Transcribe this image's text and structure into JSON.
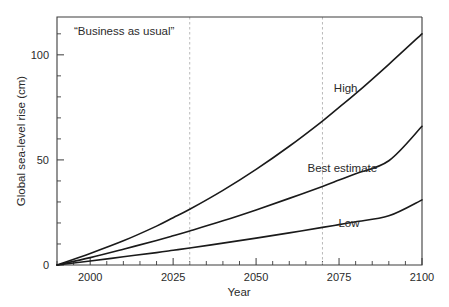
{
  "chart_data": {
    "type": "line",
    "title": "",
    "annotation": "“Business as usual”",
    "xlabel": "Year",
    "ylabel": "Global sea-level rise (cm)",
    "xlim": [
      1990,
      2100
    ],
    "ylim": [
      0,
      118
    ],
    "grid": false,
    "legend_position": "inline-right",
    "x_major_ticks": [
      2000,
      2025,
      2050,
      2075,
      2100
    ],
    "x_major_tick_labels": [
      "2000",
      "2025",
      "2050",
      "2075",
      "2100"
    ],
    "x_minor_tick_step": 5,
    "y_major_ticks": [
      0,
      50,
      100
    ],
    "y_major_tick_labels": [
      "0",
      "50",
      "100"
    ],
    "y_minor_tick_step": 10,
    "marker_lines": [
      2030,
      2070
    ],
    "x": [
      1990,
      2000,
      2010,
      2020,
      2025,
      2030,
      2040,
      2050,
      2060,
      2070,
      2075,
      2080,
      2090,
      2100
    ],
    "series": [
      {
        "name": "High",
        "label": "High",
        "color": "#1a1a1a",
        "values": [
          0,
          5.5,
          11.5,
          18.5,
          22.5,
          26.5,
          35.5,
          45.5,
          56.5,
          68.5,
          75.0,
          81.5,
          95.5,
          110.0
        ],
        "label_x": 2077,
        "label_y": 84
      },
      {
        "name": "Best estimate",
        "label": "Best estimate",
        "color": "#1a1a1a",
        "values": [
          0,
          3.5,
          7.5,
          11.7,
          13.9,
          16.2,
          21.0,
          26.2,
          31.7,
          37.4,
          40.4,
          43.4,
          49.6,
          66.0
        ],
        "label_x": 2076,
        "label_y": 46
      },
      {
        "name": "Low",
        "label": "Low",
        "color": "#1a1a1a",
        "values": [
          0,
          1.9,
          3.9,
          5.9,
          7.0,
          8.1,
          10.4,
          12.8,
          15.3,
          17.9,
          19.2,
          20.6,
          23.4,
          31.0
        ],
        "label_x": 2078,
        "label_y": 20
      }
    ]
  },
  "figure": {
    "background_color": "#ffffff",
    "axis_color": "#3c3c3c",
    "marker_line_color": "#b9b9b9"
  }
}
